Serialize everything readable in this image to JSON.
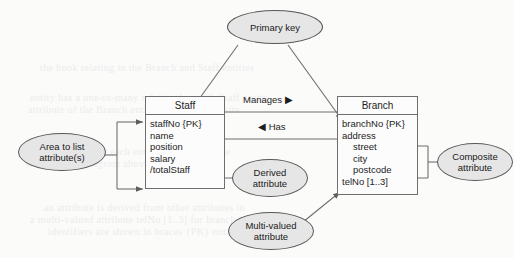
{
  "diagram": {
    "colors": {
      "page_background": "#fbfbfa",
      "entity_fill": "#fcfcfc",
      "entity_border": "#6f6f6f",
      "callout_fill": "#e6e6e6",
      "callout_border": "#585858",
      "connector": "#6f6f6f",
      "text": "#1d1d1d",
      "ghost_text": "#ececec"
    },
    "entities": [
      {
        "name": "Staff",
        "attributes": [
          {
            "label": "staffNo {PK}",
            "indent": false
          },
          {
            "label": "name",
            "indent": false
          },
          {
            "label": "position",
            "indent": false
          },
          {
            "label": "salary",
            "indent": false
          },
          {
            "label": "/totalStaff",
            "indent": false
          }
        ]
      },
      {
        "name": "Branch",
        "attributes": [
          {
            "label": "branchNo {PK}",
            "indent": false
          },
          {
            "label": "address",
            "indent": false
          },
          {
            "label": "street",
            "indent": true
          },
          {
            "label": "city",
            "indent": true
          },
          {
            "label": "postcode",
            "indent": true
          },
          {
            "label": "telNo [1..3]",
            "indent": false
          }
        ]
      }
    ],
    "relationships": [
      {
        "label": "Manages ▶",
        "name": "manages"
      },
      {
        "label": "◀ Has",
        "name": "has"
      }
    ],
    "callouts": [
      {
        "name": "primary-key",
        "line1": "Primary key",
        "line2": ""
      },
      {
        "name": "area-to-list-attributes",
        "line1": "Area to list",
        "line2": "attribute(s)"
      },
      {
        "name": "derived-attribute",
        "line1": "Derived",
        "line2": "attribute"
      },
      {
        "name": "composite-attribute",
        "line1": "Composite",
        "line2": "attribute"
      },
      {
        "name": "multi-valued-attribute",
        "line1": "Multi-valued",
        "line2": "attribute"
      }
    ],
    "ghost_lines": [
      {
        "text": "the book relating to the Branch and Staff entities",
        "x": 40,
        "y": 62
      },
      {
        "text": "entity has a one-to-many relationship with Staff entity",
        "x": 30,
        "y": 92
      },
      {
        "text": "attribute of the Branch entity and is a composite",
        "x": 28,
        "y": 104
      },
      {
        "text": "the attributes for each entity are listed below",
        "x": 34,
        "y": 146
      },
      {
        "text": "shown in the diagram above illustrates how",
        "x": 26,
        "y": 158
      },
      {
        "text": "an attribute is derived from other attributes in",
        "x": 44,
        "y": 202
      },
      {
        "text": "a multi-valued attribute telNo [1..3] for branch",
        "x": 30,
        "y": 214
      },
      {
        "text": "identifiers are shown in braces {PK} notation",
        "x": 48,
        "y": 226
      }
    ]
  }
}
